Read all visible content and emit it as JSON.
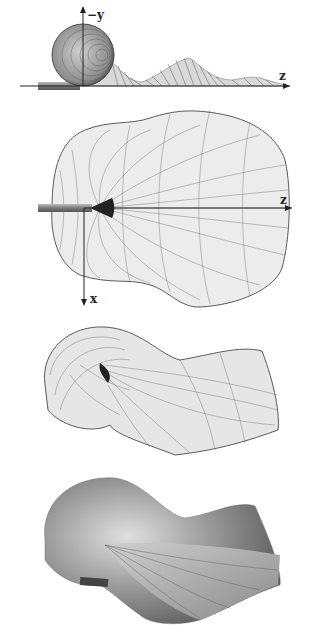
{
  "figure": {
    "panels": [
      {
        "id": "side-view",
        "description": "side view of wireframe surface with sphere-like loop",
        "axes": {
          "vertical_label": "−y",
          "horizontal_label": "z"
        }
      },
      {
        "id": "top-view",
        "description": "top view of wireframe surface",
        "axes": {
          "horizontal_label": "z",
          "vertical_label": "x"
        }
      },
      {
        "id": "perspective-wireframe",
        "description": "perspective view of wireframe surface"
      },
      {
        "id": "perspective-shaded",
        "description": "shaded rendering of surface"
      }
    ],
    "colors": {
      "background": "#ffffff",
      "mesh": "#333333",
      "axis": "#222222",
      "rod": "#8a8a8a"
    }
  }
}
